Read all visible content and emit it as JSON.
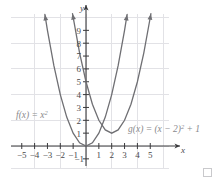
{
  "chart_data": {
    "type": "line",
    "title": "",
    "xlabel": "x",
    "ylabel": "y",
    "xlim": [
      -6,
      6.2
    ],
    "ylim": [
      -1.6,
      10.4
    ],
    "grid": true,
    "grid_step": 2,
    "legend_position": "inline-annotation",
    "x_ticks": [
      -5,
      -4,
      -3,
      -2,
      -1,
      1,
      2,
      3,
      4,
      5
    ],
    "x_tick_labels": [
      "−5",
      "−4",
      "−3",
      "−2",
      "−1",
      "1",
      "2",
      "3",
      "4",
      "5"
    ],
    "y_ticks": [
      -1,
      1,
      2,
      3,
      4,
      5,
      6,
      7,
      8,
      9
    ],
    "y_tick_labels": [
      "−1",
      "1",
      "2",
      "3",
      "4",
      "5",
      "6",
      "7",
      "8",
      "9"
    ],
    "series": [
      {
        "name": "f",
        "label_text": "f(x) = x",
        "label_exponent": "2",
        "equation": "f(x) = x^2",
        "vertex": [
          0,
          0
        ],
        "color": "#6f6f73",
        "x": [
          -3.2,
          -3.0,
          -2.5,
          -2.0,
          -1.5,
          -1.0,
          -0.5,
          0,
          0.5,
          1.0,
          1.5,
          2.0,
          2.5,
          3.0,
          3.2
        ],
        "y": [
          10.24,
          9.0,
          6.25,
          4.0,
          2.25,
          1.0,
          0.25,
          0,
          0.25,
          1.0,
          2.25,
          4.0,
          6.25,
          9.0,
          10.24
        ]
      },
      {
        "name": "g",
        "label_text": "g(x) = (x − 2)",
        "label_exponent": "2",
        "label_tail": " + 1",
        "equation": "g(x) = (x - 2)^2 + 1",
        "vertex": [
          2,
          1
        ],
        "color": "#6f6f73",
        "x": [
          -1.05,
          -0.5,
          0,
          0.5,
          1.0,
          1.5,
          2.0,
          2.5,
          3.0,
          3.5,
          4.0,
          4.5,
          5.0,
          5.05
        ],
        "y": [
          10.3,
          7.25,
          5.0,
          3.25,
          2.0,
          1.25,
          1.0,
          1.25,
          2.0,
          3.25,
          5.0,
          7.25,
          10.0,
          10.3
        ]
      }
    ],
    "axis_color": "#3a3a3c",
    "grid_color": "#e2e2e6",
    "background": "#ffffff"
  },
  "decor": {
    "corner_square_name": "corner-placeholder-square"
  }
}
